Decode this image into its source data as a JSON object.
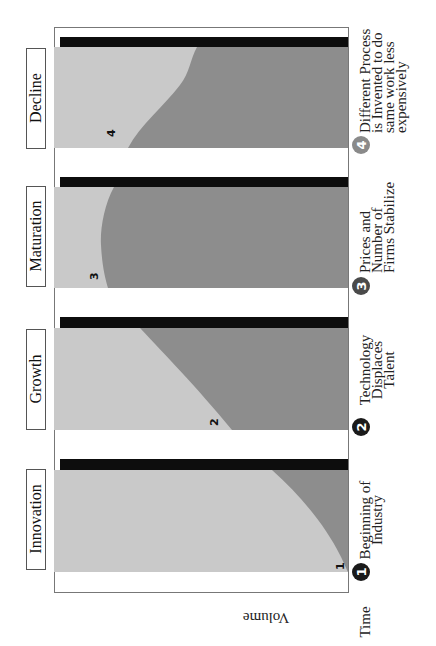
{
  "diagram": {
    "orientation": "rotated-90-ccw",
    "axes": {
      "time_label": "Time",
      "volume_label": "Volume"
    },
    "colors": {
      "light_fill": "#c9c9c9",
      "dark_fill": "#8d8d8d",
      "bar": "#0d0d0d",
      "frame": "#777777",
      "badge_dark": "#1a1a1a",
      "badge_mid": "#4a4a4a",
      "badge_light": "#8a8a8a"
    },
    "stages": [
      {
        "name": "Innovation",
        "marker": "1",
        "note_lines": [
          "Beginning of",
          "Industry"
        ]
      },
      {
        "name": "Growth",
        "marker": "2",
        "note_lines": [
          "Technology",
          "Displaces",
          "Talent"
        ]
      },
      {
        "name": "Maturation",
        "marker": "3",
        "note_lines": [
          "Prices and",
          "Number of",
          "Firms Stabilize"
        ]
      },
      {
        "name": "Decline",
        "marker": "4",
        "note_lines": [
          "Different Process",
          "is Invented to do",
          "same work less",
          "expensively"
        ]
      }
    ]
  }
}
